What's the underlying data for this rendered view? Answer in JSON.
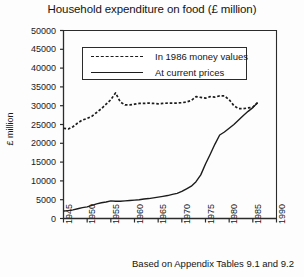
{
  "chart_data": {
    "type": "line",
    "title": "Household expenditure on food (£ million)",
    "xlabel": "",
    "ylabel": "£ million",
    "xlim": [
      1945,
      1990
    ],
    "ylim": [
      0,
      50000
    ],
    "grid": false,
    "legend_position": "top-center",
    "ytick_labels": [
      "50000",
      "45000",
      "40000",
      "35000",
      "30000",
      "25000",
      "20000",
      "15000",
      "10000",
      "5000",
      "0"
    ],
    "ytick_values": [
      50000,
      45000,
      40000,
      35000,
      30000,
      25000,
      20000,
      15000,
      10000,
      5000,
      0
    ],
    "xtick_labels": [
      "1945",
      "1950",
      "1955",
      "1960",
      "1965",
      "1970",
      "1975",
      "1980",
      "1985",
      "1990"
    ],
    "xtick_values": [
      1945,
      1950,
      1955,
      1960,
      1965,
      1970,
      1975,
      1980,
      1985,
      1990
    ],
    "annotation": "Based on Appendix Tables 9.1 and 9.2",
    "series": [
      {
        "name": "In 1986 money values",
        "style": "dashed",
        "color": "#1c1c1c",
        "x": [
          1945,
          1946,
          1947,
          1948,
          1949,
          1950,
          1951,
          1952,
          1953,
          1954,
          1955,
          1956,
          1957,
          1958,
          1959,
          1960,
          1961,
          1962,
          1963,
          1964,
          1965,
          1966,
          1967,
          1968,
          1969,
          1970,
          1971,
          1972,
          1973,
          1974,
          1975,
          1976,
          1977,
          1978,
          1979,
          1980,
          1981,
          1982,
          1983,
          1984,
          1985,
          1986
        ],
        "values": [
          24000,
          23800,
          24400,
          25400,
          26200,
          26600,
          27200,
          28200,
          29200,
          30400,
          31600,
          33400,
          31000,
          30200,
          30200,
          30400,
          30600,
          30600,
          30700,
          30600,
          30500,
          30600,
          30700,
          30700,
          30700,
          30800,
          31000,
          31400,
          32400,
          32200,
          32000,
          32400,
          32300,
          32600,
          32600,
          31600,
          30000,
          29200,
          29200,
          29400,
          29600,
          30800
        ]
      },
      {
        "name": "At current prices",
        "style": "solid",
        "color": "#1c1c1c",
        "x": [
          1945,
          1946,
          1947,
          1948,
          1949,
          1950,
          1951,
          1952,
          1953,
          1954,
          1955,
          1956,
          1957,
          1958,
          1959,
          1960,
          1961,
          1962,
          1963,
          1964,
          1965,
          1966,
          1967,
          1968,
          1969,
          1970,
          1971,
          1972,
          1973,
          1974,
          1975,
          1976,
          1977,
          1978,
          1979,
          1980,
          1981,
          1982,
          1983,
          1984,
          1985,
          1986
        ],
        "values": [
          2000,
          2100,
          2300,
          2600,
          2900,
          3100,
          3500,
          3900,
          4200,
          4400,
          4700,
          4600,
          4600,
          4700,
          4800,
          4900,
          5000,
          5200,
          5300,
          5500,
          5700,
          5900,
          6100,
          6400,
          6700,
          7200,
          7900,
          8600,
          9800,
          11600,
          14500,
          17100,
          19800,
          22200,
          23000,
          24000,
          25000,
          26200,
          27400,
          28500,
          29500,
          30800
        ]
      }
    ]
  },
  "legend": {
    "entries": [
      {
        "label": "In 1986 money values",
        "style": "dashed"
      },
      {
        "label": "At current prices",
        "style": "solid"
      }
    ]
  }
}
